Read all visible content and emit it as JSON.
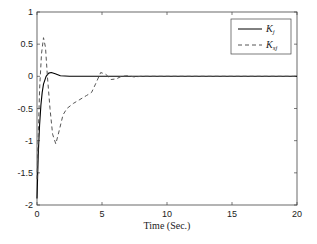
{
  "chart_data": {
    "type": "line",
    "title": "",
    "xlabel": "Time (Sec.)",
    "ylabel": "",
    "xlim": [
      0,
      20
    ],
    "ylim": [
      -2,
      1
    ],
    "xticks": [
      0,
      5,
      10,
      15,
      20
    ],
    "yticks": [
      1,
      0.5,
      0,
      -0.5,
      -1,
      -1.5,
      -2
    ],
    "xtick_labels": [
      "0",
      "5",
      "10",
      "15",
      "20"
    ],
    "ytick_labels": [
      "1",
      "0.5",
      "0",
      "-0.5",
      "-1",
      "-1.5",
      "-2"
    ],
    "grid": false,
    "legend_position": "upper right",
    "series": [
      {
        "name": "K_j",
        "label_main": "K",
        "label_sub": "j",
        "style": "solid",
        "color": "#000000",
        "x": [
          0,
          0.1,
          0.2,
          0.3,
          0.4,
          0.5,
          0.7,
          0.9,
          1.1,
          1.4,
          1.8,
          2.5,
          3.5,
          5,
          10,
          15,
          20
        ],
        "y": [
          -1.9,
          -1.2,
          -0.75,
          -0.45,
          -0.25,
          -0.12,
          0.0,
          0.05,
          0.06,
          0.04,
          0.01,
          0.0,
          0.0,
          0.0,
          0.0,
          0.0,
          0.0
        ]
      },
      {
        "name": "K_sj",
        "label_main": "K",
        "label_sub": "sj",
        "style": "dashed",
        "color": "#555555",
        "x": [
          0,
          0.1,
          0.2,
          0.35,
          0.5,
          0.65,
          0.8,
          1.0,
          1.2,
          1.45,
          1.7,
          2.0,
          2.3,
          2.8,
          3.3,
          3.8,
          4.2,
          4.5,
          4.9,
          5.3,
          5.7,
          6.1,
          6.5,
          7.0,
          7.5,
          8,
          10,
          15,
          20
        ],
        "y": [
          -1.6,
          -0.9,
          -0.2,
          0.35,
          0.6,
          0.45,
          0.0,
          -0.5,
          -0.9,
          -1.05,
          -0.85,
          -0.6,
          -0.5,
          -0.42,
          -0.36,
          -0.3,
          -0.25,
          -0.12,
          0.06,
          0.03,
          -0.05,
          -0.04,
          0.0,
          0.01,
          -0.01,
          0.0,
          0.0,
          0.0,
          0.0
        ]
      }
    ]
  },
  "legend": {
    "items": [
      {
        "main": "K",
        "sub": "j"
      },
      {
        "main": "K",
        "sub": "sj"
      }
    ]
  }
}
